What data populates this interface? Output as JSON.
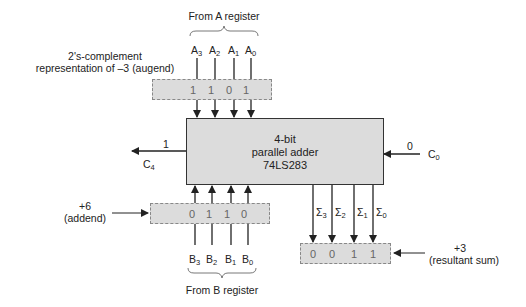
{
  "diagram": {
    "a_register": {
      "source_label": "From A register",
      "inputs": [
        {
          "name": "A",
          "sub": "3"
        },
        {
          "name": "A",
          "sub": "2"
        },
        {
          "name": "A",
          "sub": "1"
        },
        {
          "name": "A",
          "sub": "0"
        }
      ],
      "bits": [
        "1",
        "1",
        "0",
        "1"
      ],
      "description_line1": "2's-complement",
      "description_line2": "representation of –3 (augend)"
    },
    "adder": {
      "line1": "4-bit",
      "line2": "parallel adder",
      "line3": "74LS283"
    },
    "carry_out": {
      "name": "C",
      "sub": "4",
      "value": "1"
    },
    "carry_in": {
      "name": "C",
      "sub": "0",
      "value": "0"
    },
    "b_register": {
      "source_label": "From B register",
      "inputs": [
        {
          "name": "B",
          "sub": "3"
        },
        {
          "name": "B",
          "sub": "2"
        },
        {
          "name": "B",
          "sub": "1"
        },
        {
          "name": "B",
          "sub": "0"
        }
      ],
      "bits": [
        "0",
        "1",
        "1",
        "0"
      ],
      "description_line1": "+6",
      "description_line2": "(addend)"
    },
    "sum": {
      "outputs": [
        {
          "name": "Σ",
          "sub": "3"
        },
        {
          "name": "Σ",
          "sub": "2"
        },
        {
          "name": "Σ",
          "sub": "1"
        },
        {
          "name": "Σ",
          "sub": "0"
        }
      ],
      "bits": [
        "0",
        "0",
        "1",
        "1"
      ],
      "description_line1": "+3",
      "description_line2": "(resultant sum)"
    },
    "colors": {
      "box_fill": "#dcdcdc",
      "line": "#222222",
      "dashed_border": "#888888"
    }
  }
}
